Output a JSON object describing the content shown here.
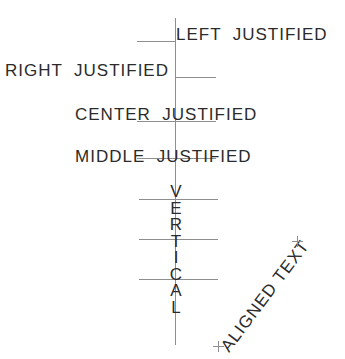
{
  "drawing": {
    "title": "Text Justification Reference",
    "line_color": "#8e8e8e",
    "text_color": "#2b2b2b",
    "background": "#ffffff",
    "width": 345,
    "height": 359
  },
  "labels": {
    "left_justified": "LEFT  JUSTIFIED",
    "right_justified": "RIGHT  JUSTIFIED",
    "center_justified": "CENTER  JUSTIFIED",
    "middle_justified": "MIDDLE  JUSTIFIED",
    "aligned_text": "ALIGNED TEXT"
  },
  "vertical_text": {
    "word": "VERTICAL",
    "letters": [
      "V",
      "E",
      "R",
      "T",
      "I",
      "C",
      "A",
      "L"
    ]
  },
  "guides": {
    "vertical_axis": {
      "x": 175,
      "y_top": 18,
      "y_bottom": 345
    },
    "horizontal_lines": [
      {
        "name": "left-justified-baseline",
        "x": 137,
        "y": 41,
        "width": 39
      },
      {
        "name": "right-justified-baseline",
        "x": 175,
        "y": 77,
        "width": 41
      },
      {
        "name": "center-justified-baseline",
        "x": 137,
        "y": 121,
        "width": 79
      },
      {
        "name": "middle-justified-baseline",
        "x": 137,
        "y": 158,
        "width": 79
      },
      {
        "name": "vertical-guide-1",
        "x": 139,
        "y": 199,
        "width": 79
      },
      {
        "name": "vertical-guide-2",
        "x": 139,
        "y": 239,
        "width": 79
      },
      {
        "name": "vertical-guide-3",
        "x": 139,
        "y": 279,
        "width": 79
      }
    ],
    "markers": [
      {
        "name": "aligned-end-marker",
        "x": 292,
        "y": 236
      },
      {
        "name": "aligned-start-marker",
        "x": 213,
        "y": 341
      }
    ]
  }
}
